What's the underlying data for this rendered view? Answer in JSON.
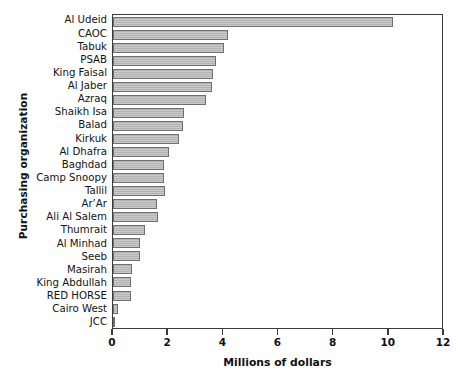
{
  "chart_data": {
    "type": "bar",
    "orientation": "horizontal",
    "title": "",
    "xlabel": "Millions of dollars",
    "ylabel": "Purchasing organization",
    "xlim": [
      0,
      12
    ],
    "xticks": [
      0,
      2,
      4,
      6,
      8,
      10,
      12
    ],
    "xticklabels": [
      "0",
      "2",
      "4",
      "6",
      "8",
      "10",
      "12"
    ],
    "grid": false,
    "legend": null,
    "bar_color": "#b3b3b3",
    "bar_edge_color": "#6f6f6f",
    "axis_color": "#3b3b3b",
    "categories": [
      "Al Udeid",
      "CAOC",
      "Tabuk",
      "PSAB",
      "King Faisal",
      "Al Jaber",
      "Azraq",
      "Shaikh Isa",
      "Balad",
      "Kirkuk",
      "Al Dhafra",
      "Baghdad",
      "Camp Snoopy",
      "Tallil",
      "Ar’Ar",
      "Ali Al Salem",
      "Thumrait",
      "Al Minhad",
      "Seeb",
      "Masirah",
      "King Abdullah",
      "RED HORSE",
      "Cairo West",
      "JCC"
    ],
    "values": [
      10.2,
      4.2,
      4.05,
      3.75,
      3.65,
      3.6,
      3.4,
      2.6,
      2.55,
      2.4,
      2.05,
      1.85,
      1.85,
      1.9,
      1.6,
      1.65,
      1.15,
      1.0,
      1.0,
      0.7,
      0.65,
      0.65,
      0.2,
      0.05
    ]
  }
}
